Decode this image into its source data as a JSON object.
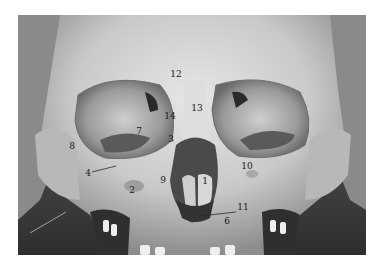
{
  "figure": {
    "labels": [
      {
        "id": "12",
        "text": "12",
        "x": 176,
        "y": 74
      },
      {
        "id": "13",
        "text": "13",
        "x": 197,
        "y": 108
      },
      {
        "id": "14",
        "text": "14",
        "x": 170,
        "y": 116
      },
      {
        "id": "7",
        "text": "7",
        "x": 139,
        "y": 131
      },
      {
        "id": "3",
        "text": "3",
        "x": 171,
        "y": 139
      },
      {
        "id": "8",
        "text": "8",
        "x": 72,
        "y": 146
      },
      {
        "id": "10",
        "text": "10",
        "x": 247,
        "y": 166
      },
      {
        "id": "4",
        "text": "4",
        "x": 88,
        "y": 173
      },
      {
        "id": "9",
        "text": "9",
        "x": 163,
        "y": 180
      },
      {
        "id": "1",
        "text": "1",
        "x": 205,
        "y": 181
      },
      {
        "id": "2",
        "text": "2",
        "x": 132,
        "y": 190
      },
      {
        "id": "11",
        "text": "11",
        "x": 243,
        "y": 207
      },
      {
        "id": "6",
        "text": "6",
        "x": 227,
        "y": 221
      }
    ]
  }
}
